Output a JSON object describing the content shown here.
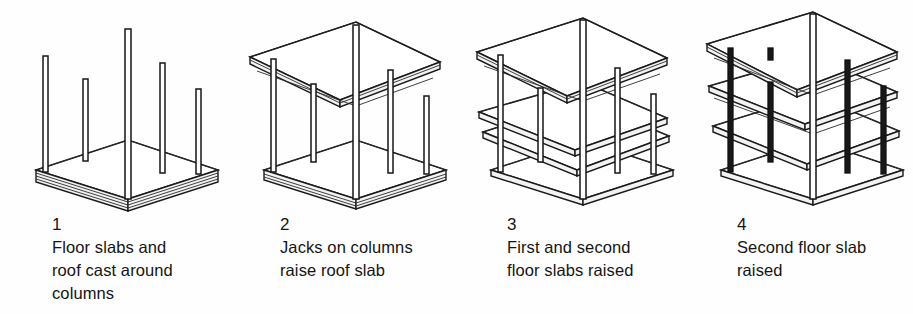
{
  "figure": {
    "background_color": "#fefefe",
    "ink_color": "#1a1a1a",
    "panel_count": 4
  },
  "panels": [
    {
      "number": "1",
      "caption": "Floor slabs and\nroof cast around\ncolumns",
      "art_name": "lift-slab-step-1-diagram",
      "description": "Isometric view of a stack of cast concrete slabs on the ground with five vertical columns rising through them",
      "slab_stack_count": 4,
      "column_count": 5,
      "raised_slabs": 0
    },
    {
      "number": "2",
      "caption": "Jacks on columns\nraise roof slab",
      "art_name": "lift-slab-step-2-diagram",
      "description": "Roof slab jacked to the top of the columns, remaining floor slabs still stacked at ground level",
      "slab_stack_count": 3,
      "column_count": 5,
      "raised_slabs": 1
    },
    {
      "number": "3",
      "caption": "First and second\nfloor slabs raised",
      "art_name": "lift-slab-step-3-diagram",
      "description": "Roof slab at the top with first and second floor slabs raised to intermediate heights above the ground slab",
      "slab_stack_count": 1,
      "column_count": 5,
      "raised_slabs": 3
    },
    {
      "number": "4",
      "caption": "Second floor slab\nraised",
      "art_name": "lift-slab-step-4-diagram",
      "description": "Completed frame with roof, second floor slab and first floor slab all raised into final position over the ground slab",
      "slab_stack_count": 1,
      "column_count": 5,
      "raised_slabs": 3
    }
  ]
}
